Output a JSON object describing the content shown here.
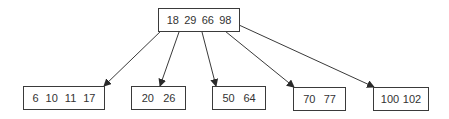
{
  "diagram": {
    "type": "b-tree",
    "root": {
      "keys": [
        "18",
        "29",
        "66",
        "98"
      ]
    },
    "leaves": [
      {
        "keys": [
          "6",
          "10",
          "11",
          "17"
        ]
      },
      {
        "keys": [
          "20",
          "26"
        ]
      },
      {
        "keys": [
          "50",
          "64"
        ]
      },
      {
        "keys": [
          "70",
          "77"
        ]
      },
      {
        "keys": [
          "100",
          "102"
        ]
      }
    ],
    "colors": {
      "line": "#3a3a3a",
      "text": "#333333",
      "background": "#ffffff"
    }
  }
}
